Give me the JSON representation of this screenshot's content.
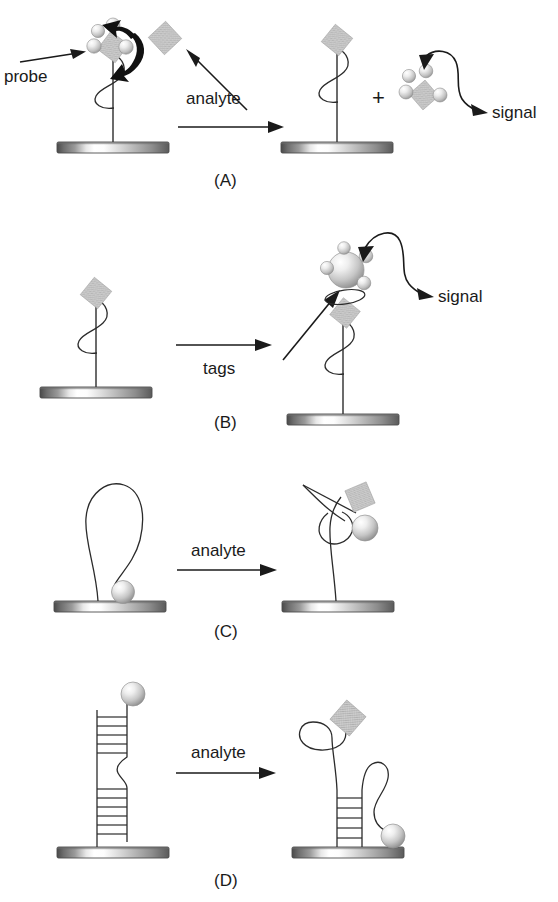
{
  "figure": {
    "type": "scientific-schematic",
    "background_color": "#ffffff",
    "ink_color": "#1a1a1a",
    "palette": {
      "analyte_diamond_fill": "#c9c9c9",
      "analyte_diamond_edge": "#a8a8a8",
      "sphere_light": "#f2f2f2",
      "sphere_mid": "#cfcfcf",
      "sphere_dark": "#8e8e8e",
      "substrate_dark": "#595959",
      "substrate_light": "#ffffff",
      "strand_stroke": "#2b2b2b",
      "arrow_black": "#111111"
    }
  },
  "panels": [
    {
      "id": "A",
      "letter": "(A)",
      "labels": {
        "probe": "probe",
        "reaction": "analyte",
        "plus": "+",
        "signal": "signal"
      },
      "left_state": {
        "name": "probe-with-bound-tagged-analyte",
        "components": [
          "substrate-bar",
          "tether-line",
          "helix-squiggle",
          "analyte-diamond",
          "tag-spheres-4"
        ]
      },
      "right_state": {
        "name": "probe-with-analyte-and-released-tag-cluster",
        "components": [
          "substrate-bar",
          "tether-line",
          "helix-squiggle",
          "analyte-diamond",
          "released-tag-cluster"
        ]
      },
      "arrows": [
        {
          "name": "probe-pointer-arrow",
          "style": "thin-straight"
        },
        {
          "name": "displacement-arrow",
          "style": "thick-curved-double-headed"
        },
        {
          "name": "analyte-pointer-arrow",
          "style": "thin-straight-diagonal"
        },
        {
          "name": "reaction-arrow",
          "style": "thin-straight-horizontal"
        },
        {
          "name": "signal-arrow",
          "style": "thin-curved-s"
        }
      ]
    },
    {
      "id": "B",
      "letter": "(B)",
      "labels": {
        "reaction": "tags",
        "signal": "signal"
      },
      "left_state": {
        "name": "probe-with-bound-analyte",
        "components": [
          "substrate-bar",
          "tether-line",
          "helix-squiggle",
          "analyte-diamond"
        ]
      },
      "right_state": {
        "name": "probe-analyte-with-tag-cluster",
        "components": [
          "substrate-bar",
          "tether-line",
          "helix-squiggle",
          "analyte-diamond",
          "large-sphere",
          "satellite-spheres-4",
          "ellipse-linker"
        ]
      },
      "arrows": [
        {
          "name": "reaction-arrow",
          "style": "thin-straight-horizontal"
        },
        {
          "name": "tag-attach-arrow",
          "style": "thin-straight-diagonal"
        },
        {
          "name": "signal-arrow",
          "style": "thin-curved-s"
        }
      ]
    },
    {
      "id": "C",
      "letter": "(C)",
      "labels": {
        "reaction": "analyte"
      },
      "left_state": {
        "name": "closed-stem-loop-quenched",
        "components": [
          "substrate-bar",
          "hairpin-loop-strand",
          "reporter-sphere-at-surface"
        ]
      },
      "right_state": {
        "name": "opened-strand-with-analyte-bound",
        "components": [
          "substrate-bar",
          "extended-strand",
          "analyte-diamond-tilted",
          "reporter-sphere-raised"
        ]
      },
      "arrows": [
        {
          "name": "reaction-arrow",
          "style": "thin-straight-horizontal"
        }
      ]
    },
    {
      "id": "D",
      "letter": "(D)",
      "labels": {
        "reaction": "analyte"
      },
      "left_state": {
        "name": "closed-duplex-with-internal-bulge",
        "components": [
          "substrate-bar",
          "duplex-ladder",
          "internal-bulge-loop",
          "reporter-sphere-top"
        ]
      },
      "right_state": {
        "name": "partially-opened-duplex-with-analyte",
        "components": [
          "substrate-bar",
          "short-duplex-ladder",
          "loop-around-analyte",
          "analyte-diamond",
          "displaced-strand-loop",
          "reporter-sphere-lowered"
        ]
      },
      "arrows": [
        {
          "name": "reaction-arrow",
          "style": "thin-straight-horizontal"
        }
      ]
    }
  ]
}
